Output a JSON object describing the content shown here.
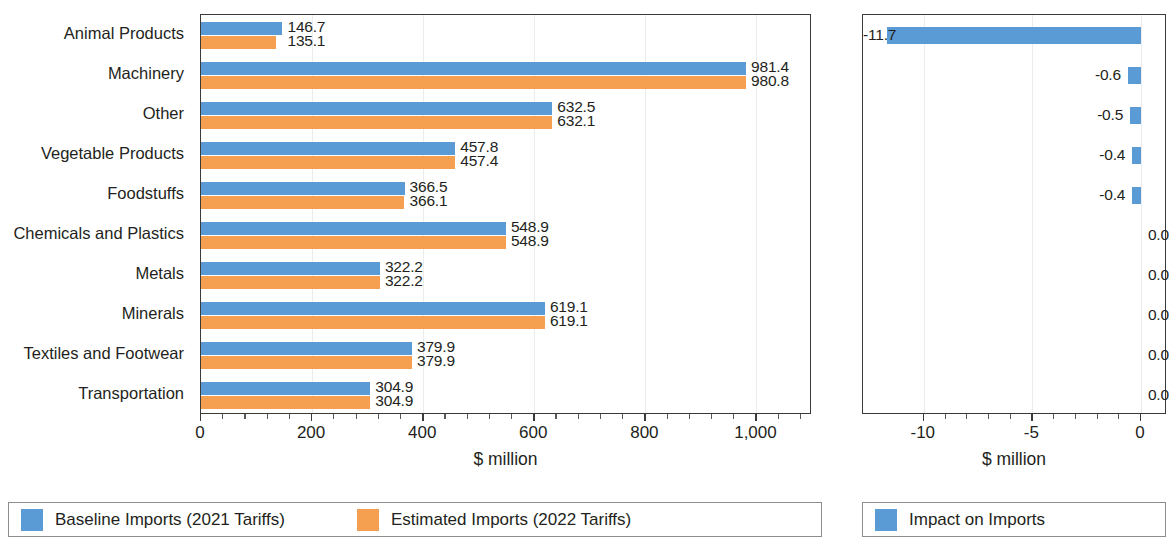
{
  "chart_data": [
    {
      "type": "bar",
      "orientation": "horizontal",
      "panel": "left",
      "title": "",
      "xlabel": "$ million",
      "ylabel": "",
      "xlim": [
        0,
        1100
      ],
      "xticks": [
        0,
        200,
        400,
        600,
        800,
        1000
      ],
      "xticklabels": [
        "0",
        "200",
        "400",
        "600",
        "800",
        "1,000"
      ],
      "grid": true,
      "legend_position": "bottom",
      "categories": [
        "Animal Products",
        "Machinery",
        "Other",
        "Vegetable Products",
        "Foodstuffs",
        "Chemicals and Plastics",
        "Metals",
        "Minerals",
        "Textiles and Footwear",
        "Transportation"
      ],
      "series": [
        {
          "name": "Baseline Imports (2021 Tariffs)",
          "color": "#5B9BD5",
          "values": [
            146.7,
            981.4,
            632.5,
            457.8,
            366.5,
            548.9,
            322.2,
            619.1,
            379.9,
            304.9
          ],
          "labels": [
            "146.7",
            "981.4",
            "632.5",
            "457.8",
            "366.5",
            "548.9",
            "322.2",
            "619.1",
            "379.9",
            "304.9"
          ]
        },
        {
          "name": "Estimated Imports (2022 Tariffs)",
          "color": "#F4A050",
          "values": [
            135.1,
            980.8,
            632.1,
            457.4,
            366.1,
            548.9,
            322.2,
            619.1,
            379.9,
            304.9
          ],
          "labels": [
            "135.1",
            "980.8",
            "632.1",
            "457.4",
            "366.1",
            "548.9",
            "322.2",
            "619.1",
            "379.9",
            "304.9"
          ]
        }
      ]
    },
    {
      "type": "bar",
      "orientation": "horizontal",
      "panel": "right",
      "title": "",
      "xlabel": "$ million",
      "ylabel": "",
      "xlim": [
        -12.8,
        1.2
      ],
      "xticks": [
        -10,
        -5,
        0
      ],
      "xticklabels": [
        "-10",
        "-5",
        "0"
      ],
      "grid": true,
      "legend_position": "bottom",
      "categories": [
        "Animal Products",
        "Machinery",
        "Other",
        "Vegetable Products",
        "Foodstuffs",
        "Chemicals and Plastics",
        "Metals",
        "Minerals",
        "Textiles and Footwear",
        "Transportation"
      ],
      "series": [
        {
          "name": "Impact on Imports",
          "color": "#5B9BD5",
          "values": [
            -11.7,
            -0.6,
            -0.5,
            -0.4,
            -0.4,
            0.0,
            0.0,
            0.0,
            0.0,
            0.0
          ],
          "labels": [
            "-11.7",
            "-0.6",
            "-0.5",
            "-0.4",
            "-0.4",
            "0.0",
            "0.0",
            "0.0",
            "0.0",
            "0.0"
          ]
        }
      ]
    }
  ],
  "left_panel": {
    "axis_title": "$ million",
    "xticklabels": [
      "0",
      "200",
      "400",
      "600",
      "800",
      "1,000"
    ],
    "categories": [
      "Animal Products",
      "Machinery",
      "Other",
      "Vegetable Products",
      "Foodstuffs",
      "Chemicals and Plastics",
      "Metals",
      "Minerals",
      "Textiles and Footwear",
      "Transportation"
    ],
    "baseline_labels": [
      "146.7",
      "981.4",
      "632.5",
      "457.8",
      "366.5",
      "548.9",
      "322.2",
      "619.1",
      "379.9",
      "304.9"
    ],
    "estimated_labels": [
      "135.1",
      "980.8",
      "632.1",
      "457.4",
      "366.1",
      "548.9",
      "322.2",
      "619.1",
      "379.9",
      "304.9"
    ],
    "legend": [
      {
        "label": "Baseline Imports (2021 Tariffs)",
        "color": "#5B9BD5"
      },
      {
        "label": "Estimated Imports (2022 Tariffs)",
        "color": "#F4A050"
      }
    ]
  },
  "right_panel": {
    "axis_title": "$ million",
    "xticklabels": [
      "-10",
      "-5",
      "0"
    ],
    "value_labels": [
      "-11.7",
      "-0.6",
      "-0.5",
      "-0.4",
      "-0.4",
      "0.0",
      "0.0",
      "0.0",
      "0.0",
      "0.0"
    ],
    "legend": [
      {
        "label": "Impact on Imports",
        "color": "#5B9BD5"
      }
    ]
  },
  "colors": {
    "baseline_blue": "#5B9BD5",
    "estimated_orange": "#F4A050",
    "axis": "#3a3a3a",
    "grid": "#ececec",
    "text": "#231f20"
  }
}
